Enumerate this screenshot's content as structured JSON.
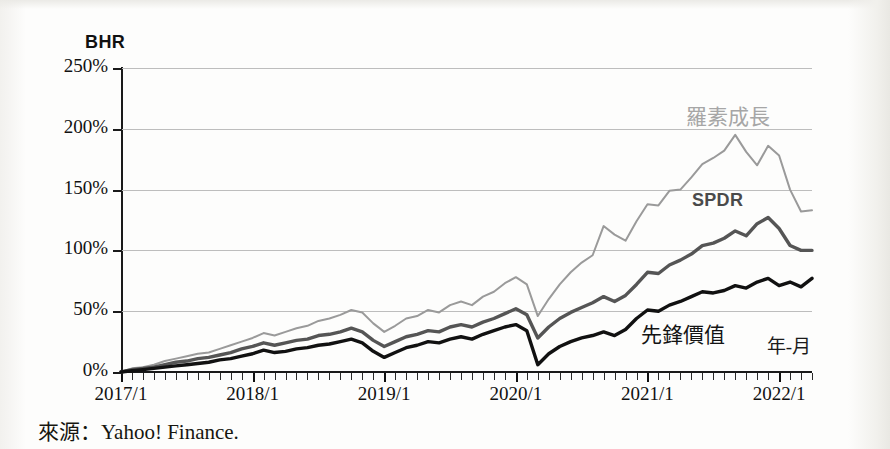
{
  "source_note": "來源：Yahoo! Finance.",
  "chart_data": {
    "type": "line",
    "title": "",
    "ylabel": "BHR",
    "xlabel": "年-月",
    "ylim": [
      0,
      250
    ],
    "y_ticks": [
      "0%",
      "50%",
      "100%",
      "150%",
      "200%",
      "250%"
    ],
    "y_tick_values": [
      0,
      50,
      100,
      150,
      200,
      250
    ],
    "x_ticks": [
      "2017/1",
      "2018/1",
      "2019/1",
      "2020/1",
      "2021/1",
      "2022/1"
    ],
    "x_tick_index": [
      0,
      12,
      24,
      36,
      48,
      60
    ],
    "x_minor_tick_interval_months": 1,
    "x_range_months": [
      0,
      63
    ],
    "grid": "horizontal",
    "legend_position": "inline-annotations",
    "colors": {
      "russell_growth": "#9a9a9a",
      "spdr": "#555555",
      "vanguard_value": "#111111",
      "gridline": "#bdbdbd",
      "axis": "#1a1a1a",
      "background": "#fdfdfc"
    },
    "series": [
      {
        "name": "羅素成長",
        "label": "羅素成長",
        "color": "#9a9a9a",
        "values": [
          0,
          3,
          4,
          6,
          9,
          11,
          13,
          15,
          16,
          19,
          22,
          25,
          28,
          32,
          30,
          33,
          36,
          38,
          42,
          44,
          47,
          51,
          49,
          40,
          33,
          38,
          44,
          46,
          51,
          49,
          55,
          58,
          55,
          62,
          66,
          73,
          78,
          72,
          46,
          60,
          72,
          82,
          90,
          96,
          120,
          113,
          108,
          124,
          138,
          137,
          149,
          150,
          160,
          171,
          176,
          182,
          195,
          181,
          170,
          186,
          178,
          150,
          132,
          133
        ]
      },
      {
        "name": "SPDR",
        "label": "SPDR",
        "color": "#555555",
        "values": [
          0,
          2,
          3,
          4,
          6,
          8,
          9,
          11,
          12,
          14,
          16,
          19,
          21,
          24,
          22,
          24,
          26,
          27,
          30,
          31,
          33,
          36,
          33,
          26,
          21,
          25,
          29,
          31,
          34,
          33,
          37,
          39,
          37,
          41,
          44,
          48,
          52,
          47,
          28,
          37,
          44,
          49,
          53,
          57,
          62,
          58,
          63,
          72,
          82,
          81,
          88,
          92,
          97,
          104,
          106,
          110,
          116,
          112,
          122,
          127,
          118,
          104,
          100,
          100
        ]
      },
      {
        "name": "先鋒價值",
        "label": "先鋒價值",
        "color": "#111111",
        "values": [
          0,
          1,
          2,
          3,
          4,
          5,
          6,
          7,
          8,
          10,
          11,
          13,
          15,
          18,
          16,
          17,
          19,
          20,
          22,
          23,
          25,
          27,
          24,
          17,
          12,
          16,
          20,
          22,
          25,
          24,
          27,
          29,
          27,
          31,
          34,
          37,
          39,
          34,
          6,
          15,
          21,
          25,
          28,
          30,
          33,
          30,
          35,
          44,
          51,
          50,
          55,
          58,
          62,
          66,
          65,
          67,
          71,
          69,
          74,
          77,
          71,
          74,
          70,
          77
        ]
      }
    ]
  }
}
